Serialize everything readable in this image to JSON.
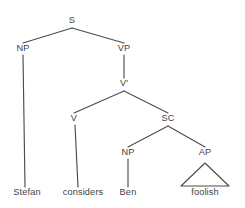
{
  "diagram": {
    "type": "syntax-tree",
    "sentence": "Stefan considers Ben foolish",
    "ink_color": "#4d4d4d",
    "text_color": "#3f3f3f",
    "background_color": "#ffffff",
    "nodes": [
      {
        "id": "s",
        "label": "S",
        "x": 72,
        "y": 21
      },
      {
        "id": "np1",
        "label": "NP",
        "x": 23,
        "y": 49
      },
      {
        "id": "vp",
        "label": "VP",
        "x": 124,
        "y": 49
      },
      {
        "id": "vbar",
        "label": "V'",
        "x": 124,
        "y": 84
      },
      {
        "id": "v",
        "label": "V",
        "x": 74,
        "y": 119
      },
      {
        "id": "sc",
        "label": "SC",
        "x": 168,
        "y": 119
      },
      {
        "id": "np2",
        "label": "NP",
        "x": 128,
        "y": 153
      },
      {
        "id": "ap",
        "label": "AP",
        "x": 205,
        "y": 153
      }
    ],
    "leaves": [
      {
        "id": "leaf-stefan",
        "label": "Stefan",
        "x": 27,
        "y": 193
      },
      {
        "id": "leaf-considers",
        "label": "considers",
        "x": 83,
        "y": 193
      },
      {
        "id": "leaf-ben",
        "label": "Ben",
        "x": 128,
        "y": 193
      },
      {
        "id": "leaf-foolish",
        "label": "foolish",
        "x": 205,
        "y": 193
      }
    ],
    "branches": [
      {
        "id": "s-to-np1",
        "from": "s",
        "to": "np1",
        "x1": 72,
        "y1": 28,
        "x2": 23,
        "y2": 43
      },
      {
        "id": "s-to-vp",
        "from": "s",
        "to": "vp",
        "x1": 72,
        "y1": 28,
        "x2": 124,
        "y2": 43
      },
      {
        "id": "np1-to-stefan",
        "from": "np1",
        "to": "leaf-stefan",
        "x1": 23,
        "y1": 55,
        "x2": 25,
        "y2": 187
      },
      {
        "id": "vp-to-vbar",
        "from": "vp",
        "to": "vbar",
        "x1": 124,
        "y1": 55,
        "x2": 124,
        "y2": 78
      },
      {
        "id": "vbar-to-v",
        "from": "vbar",
        "to": "v",
        "x1": 124,
        "y1": 91,
        "x2": 74,
        "y2": 113
      },
      {
        "id": "vbar-to-sc",
        "from": "vbar",
        "to": "sc",
        "x1": 124,
        "y1": 91,
        "x2": 168,
        "y2": 113
      },
      {
        "id": "v-to-considers",
        "from": "v",
        "to": "leaf-considers",
        "x1": 75,
        "y1": 125,
        "x2": 78,
        "y2": 187
      },
      {
        "id": "sc-to-np2",
        "from": "sc",
        "to": "np2",
        "x1": 168,
        "y1": 126,
        "x2": 128,
        "y2": 147
      },
      {
        "id": "sc-to-ap",
        "from": "sc",
        "to": "ap",
        "x1": 168,
        "y1": 126,
        "x2": 205,
        "y2": 147
      },
      {
        "id": "np2-to-ben",
        "from": "np2",
        "to": "leaf-ben",
        "x1": 128,
        "y1": 159,
        "x2": 128,
        "y2": 187
      }
    ],
    "triangles": [
      {
        "id": "ap-triangle",
        "from": "ap",
        "to": "leaf-foolish",
        "apex_x": 205,
        "apex_y": 163,
        "left_x": 181,
        "base_y": 186,
        "right_x": 229
      }
    ]
  }
}
